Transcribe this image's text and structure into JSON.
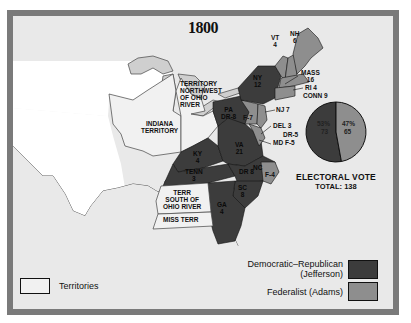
{
  "title": "1800",
  "colors": {
    "democratic_republican": "#3c3c3c",
    "federalist": "#8e8e8e",
    "territory": "#f1f1f1",
    "frame": "#7a7a7a",
    "background": "#e9e9e9"
  },
  "map_labels": {
    "vt": "VT\n4",
    "nh": "NH\n6",
    "mass": "MASS\n16",
    "ri": "RI 4",
    "conn": "CONN 9",
    "ny": "NY\n12",
    "pa": "PA\nDR-8",
    "nj_f": "F-7",
    "nj": "NJ 7",
    "del": "DEL 3",
    "md1": "DR-5",
    "md2": "MD F-5",
    "ky": "KY\n4",
    "va": "VA\n21",
    "tenn": "TENN\n3",
    "nc_dr": "DR 8",
    "nc": "NC",
    "nc_f": "F-4",
    "sc": "SC\n8",
    "ga": "GA\n4",
    "territory_nw": "TERRITORY\nNORTHWEST\nOF OHIO\nRIVER",
    "indiana": "INDIANA\nTERRITORY",
    "terr_south": "TERR\nSOUTH OF\nOHIO RIVER",
    "miss_terr": "MISS TERR"
  },
  "electoral_vote": {
    "title": "ELECTORAL VOTE",
    "total_label": "TOTAL: 138",
    "slices": [
      {
        "party": "Democratic-Republican",
        "percent_label": "53%",
        "votes": 73,
        "votes_label": "73"
      },
      {
        "party": "Federalist",
        "percent_label": "47%",
        "votes": 65,
        "votes_label": "65"
      }
    ]
  },
  "legend": {
    "territories": "Territories",
    "democratic_republican": "Democratic–Republican\n(Jefferson)",
    "federalist": "Federalist (Adams)"
  }
}
